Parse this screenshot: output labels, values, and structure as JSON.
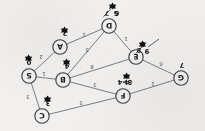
{
  "diagram": {
    "type": "weighted-undirected-graph",
    "orientation_degrees": 180,
    "nodes": [
      {
        "id": "S",
        "label": "S",
        "dist": "0",
        "x": 176,
        "y": 55,
        "dist_dx": 0,
        "dist_dy": 14
      },
      {
        "id": "C",
        "label": "C",
        "dist": "3",
        "x": 163,
        "y": 15,
        "dist_dx": -6,
        "dist_dy": 13
      },
      {
        "id": "B",
        "label": "B",
        "dist": "4",
        "x": 142,
        "y": 51,
        "dist_dx": -4,
        "dist_dy": 14
      },
      {
        "id": "A",
        "label": "A",
        "dist": "2",
        "x": 145,
        "y": 84,
        "dist_dx": -5,
        "dist_dy": 14
      },
      {
        "id": "F",
        "label": "F",
        "dist": "4",
        "x": 82,
        "y": 35,
        "dist_dx": -4,
        "dist_dy": 14
      },
      {
        "id": "G",
        "label": "G",
        "dist": "7",
        "x": 24,
        "y": 53,
        "dist_dx": -1,
        "dist_dy": 13
      },
      {
        "id": "E",
        "label": "E",
        "dist": "6",
        "x": 69,
        "y": 74,
        "dist_dx": -7,
        "dist_dy": 13
      },
      {
        "id": "D",
        "label": "D",
        "dist": "5",
        "x": 96,
        "y": 105,
        "dist_dx": -7,
        "dist_dy": 13
      }
    ],
    "edges": [
      {
        "from": "S",
        "to": "C",
        "weight": "3",
        "lx": 177,
        "ly": 34
      },
      {
        "from": "S",
        "to": "B",
        "weight": "1",
        "lx": 161,
        "ly": 57
      },
      {
        "from": "S",
        "to": "A",
        "weight": "2",
        "lx": 164,
        "ly": 74
      },
      {
        "from": "C",
        "to": "F",
        "weight": "5",
        "lx": 124,
        "ly": 28
      },
      {
        "from": "B",
        "to": "F",
        "weight": "3",
        "lx": 110,
        "ly": 46
      },
      {
        "from": "B",
        "to": "E",
        "weight": "8",
        "lx": 113,
        "ly": 64
      },
      {
        "from": "B",
        "to": "D",
        "weight": "5",
        "lx": 118,
        "ly": 81
      },
      {
        "from": "A",
        "to": "D",
        "weight": "1",
        "lx": 121,
        "ly": 96
      },
      {
        "from": "F",
        "to": "G",
        "weight": "1",
        "lx": 52,
        "ly": 47
      },
      {
        "from": "G",
        "to": "E",
        "weight": "6",
        "lx": 44,
        "ly": 67
      },
      {
        "from": "E",
        "to": "D",
        "weight": "1",
        "lx": 79,
        "ly": 92
      }
    ],
    "annotations": [
      {
        "name": "f-relax-note",
        "text": "8>4",
        "x": 80,
        "y": 49
      },
      {
        "name": "e-relax-note",
        "text": "9",
        "x": 58,
        "y": 80
      },
      {
        "name": "d-relax-note",
        "text": "6",
        "x": 88,
        "y": 118
      }
    ],
    "struck_values": [
      {
        "name": "struck-e-value",
        "text": "8",
        "x": 66,
        "y": 81
      },
      {
        "name": "struck-d-value",
        "text": "7",
        "x": 98,
        "y": 118
      }
    ],
    "pointer": {
      "name": "e-pointer-arrow",
      "x1": 46,
      "y1": 92,
      "x2": 57,
      "y2": 84
    },
    "colors": {
      "paper": "#f3f2f0",
      "edge": "#6f6f6f",
      "node_stroke": "#3a3a3a",
      "text": "#1a1a1a",
      "weight_text": "#555555"
    }
  }
}
